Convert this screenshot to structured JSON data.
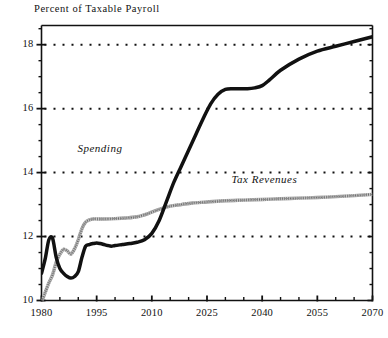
{
  "chart_data": {
    "type": "line",
    "title": "Percent of Taxable Payroll",
    "xlabel": "",
    "ylabel": "Percent of Taxable Payroll",
    "xlim": [
      1980,
      2070
    ],
    "ylim": [
      10,
      18.6
    ],
    "grid": true,
    "grid_style": "dotted-horizontal",
    "legend_position": "inline-annotation",
    "x_ticks": [
      1980,
      1995,
      2010,
      2025,
      2040,
      2055,
      2070
    ],
    "x_tick_labels": [
      "1980",
      "1995",
      "2010",
      "2025",
      "2040",
      "2055",
      "2070"
    ],
    "x_minor_tick_interval": 5,
    "y_ticks": [
      10,
      12,
      14,
      16,
      18
    ],
    "y_tick_labels": [
      "10",
      "12",
      "14",
      "16",
      "18"
    ],
    "y_minor_tick_interval": 0.5,
    "series": [
      {
        "name": "Spending",
        "color": "#111111",
        "style": "solid-thick-black",
        "label_x": 2005,
        "label_y": 14.7,
        "x": [
          1980,
          1981,
          1982,
          1983,
          1984,
          1985,
          1986,
          1987,
          1988,
          1989,
          1990,
          1991,
          1992,
          1993,
          1994,
          1995,
          1996,
          1997,
          1998,
          1999,
          2000,
          2002,
          2004,
          2006,
          2008,
          2010,
          2012,
          2014,
          2016,
          2018,
          2020,
          2022,
          2024,
          2026,
          2028,
          2030,
          2032,
          2034,
          2036,
          2038,
          2040,
          2042,
          2045,
          2050,
          2055,
          2060,
          2065,
          2070
        ],
        "y": [
          10.85,
          11.3,
          11.9,
          11.95,
          11.35,
          11.0,
          10.85,
          10.75,
          10.7,
          10.75,
          10.9,
          11.35,
          11.7,
          11.75,
          11.78,
          11.8,
          11.78,
          11.75,
          11.72,
          11.7,
          11.72,
          11.75,
          11.78,
          11.82,
          11.9,
          12.1,
          12.5,
          13.1,
          13.7,
          14.2,
          14.7,
          15.2,
          15.7,
          16.15,
          16.45,
          16.6,
          16.62,
          16.62,
          16.62,
          16.65,
          16.72,
          16.9,
          17.2,
          17.55,
          17.8,
          17.95,
          18.1,
          18.25
        ]
      },
      {
        "name": "Tax Revenues",
        "color": "#999999",
        "style": "hatched-gray",
        "label_x": 2042,
        "label_y": 13.75,
        "x": [
          1980,
          1981,
          1982,
          1983,
          1984,
          1985,
          1986,
          1987,
          1988,
          1989,
          1990,
          1991,
          1992,
          1993,
          1994,
          1995,
          1997,
          2000,
          2003,
          2006,
          2009,
          2012,
          2015,
          2018,
          2021,
          2025,
          2030,
          2035,
          2040,
          2045,
          2050,
          2055,
          2060,
          2065,
          2070
        ],
        "y": [
          9.95,
          10.25,
          10.55,
          10.8,
          11.2,
          11.45,
          11.6,
          11.55,
          11.45,
          11.62,
          11.9,
          12.25,
          12.45,
          12.52,
          12.55,
          12.55,
          12.55,
          12.56,
          12.58,
          12.62,
          12.72,
          12.85,
          12.95,
          13.0,
          13.05,
          13.08,
          13.12,
          13.14,
          13.16,
          13.18,
          13.2,
          13.22,
          13.25,
          13.28,
          13.32
        ]
      }
    ]
  },
  "colors": {
    "spending": "#111111",
    "tax_revenues": "#999999",
    "axis": "#111111",
    "background": "#ffffff"
  }
}
